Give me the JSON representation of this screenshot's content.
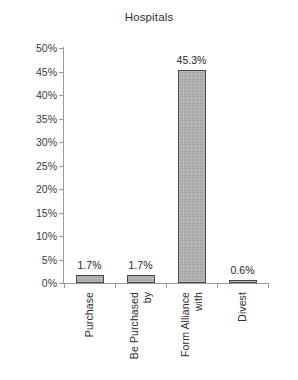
{
  "chart_data": {
    "type": "bar",
    "title": "Hospitals",
    "xlabel": "",
    "ylabel": "",
    "categories": [
      "Purchase",
      "Be Purchased by",
      "Form Alliance with",
      "Divest"
    ],
    "category_lines": [
      [
        "Purchase"
      ],
      [
        "Be Purchased",
        "by"
      ],
      [
        "Form Alliance",
        "with"
      ],
      [
        "Divest"
      ]
    ],
    "values": [
      1.7,
      1.7,
      45.3,
      0.6
    ],
    "value_labels": [
      "1.7%",
      "1.7%",
      "45.3%",
      "0.6%"
    ],
    "ylim": [
      0,
      50
    ],
    "ytick_values": [
      50,
      45,
      40,
      35,
      30,
      25,
      20,
      15,
      10,
      5,
      0
    ],
    "ytick_labels": [
      "50%",
      "45%",
      "40%",
      "35%",
      "30%",
      "25%",
      "20%",
      "15%",
      "10%",
      "5%",
      "0%"
    ],
    "grid": false,
    "legend": "none",
    "bar_color": "#a9a9a9",
    "bar_border_color": "#4a4a4a",
    "axis_color": "#9a9a9a",
    "text_color": "#2f2f2f"
  }
}
